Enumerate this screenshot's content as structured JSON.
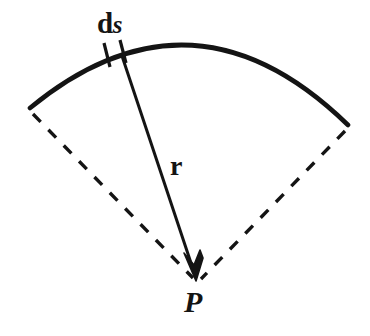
{
  "figure": {
    "background_color": "#ffffff",
    "ink_color": "#141414",
    "width": 370,
    "height": 336,
    "labels": {
      "arc_element_prefix": "d",
      "arc_element_symbol": "s",
      "radius_vector": "r",
      "point": "P"
    },
    "geometry": {
      "vertex": {
        "x": 196,
        "y": 281
      },
      "arc": {
        "start": {
          "x": 30,
          "y": 108
        },
        "control": {
          "x": 193,
          "y": -26
        },
        "end": {
          "x": 348,
          "y": 125
        },
        "stroke_width": 4.6,
        "style": "solid"
      },
      "left_radius": {
        "from": {
          "x": 33,
          "y": 114
        },
        "to": {
          "x": 193,
          "y": 278
        },
        "style": "dashed",
        "stroke_width": 3.4,
        "dash_pattern": "11 11"
      },
      "right_radius": {
        "from": {
          "x": 345,
          "y": 131
        },
        "to": {
          "x": 201,
          "y": 279
        },
        "style": "dashed",
        "stroke_width": 3.4,
        "dash_pattern": "11 11"
      },
      "radius_vector": {
        "from": {
          "x": 122,
          "y": 56
        },
        "to": {
          "x": 196,
          "y": 281
        },
        "style": "solid",
        "stroke_width": 3.0,
        "arrowhead": "filled-v"
      },
      "tick_marks": [
        {
          "x1": 105,
          "y1": 44,
          "x2": 110,
          "y2": 66
        },
        {
          "x1": 121,
          "y1": 41,
          "x2": 126,
          "y2": 62
        }
      ]
    }
  }
}
